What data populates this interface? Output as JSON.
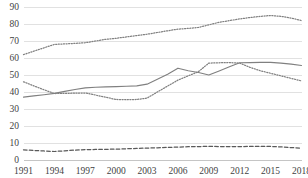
{
  "chart_data": {
    "type": "line",
    "title": "",
    "subtitle": "",
    "xlabel": "",
    "ylabel": "",
    "grid": true,
    "legend": "none",
    "xlim": [
      1991,
      2018
    ],
    "ylim": [
      0,
      90
    ],
    "yticks": [
      0,
      10,
      20,
      30,
      40,
      50,
      60,
      70,
      80,
      90
    ],
    "ytick_labels": [
      "0",
      "10",
      "20",
      "30",
      "40",
      "50",
      "60",
      "70",
      "80",
      "90"
    ],
    "xticks": [
      1991,
      1994,
      1997,
      2000,
      2003,
      2006,
      2009,
      2012,
      2015,
      2018
    ],
    "xtick_labels": [
      "1991",
      "1994",
      "1997",
      "2000",
      "2003",
      "2006",
      "2009",
      "2012",
      "2015",
      "2018"
    ],
    "x": [
      1991,
      1992,
      1993,
      1994,
      1995,
      1996,
      1997,
      1998,
      1999,
      2000,
      2001,
      2002,
      2003,
      2004,
      2005,
      2006,
      2007,
      2008,
      2009,
      2010,
      2011,
      2012,
      2013,
      2014,
      2015,
      2016,
      2017,
      2018
    ],
    "series": [
      {
        "name": "series-top-dotted",
        "style": "dotted",
        "color": "#808080",
        "values": [
          62.0,
          64.0,
          66.0,
          68.0,
          68.3,
          68.6,
          69.0,
          70.0,
          71.0,
          71.6,
          72.4,
          73.2,
          74.0,
          75.0,
          76.0,
          77.0,
          77.4,
          78.0,
          79.5,
          81.0,
          82.0,
          83.0,
          83.8,
          84.5,
          85.0,
          84.5,
          83.5,
          82.0
        ]
      },
      {
        "name": "series-solid",
        "style": "solid",
        "color": "#808080",
        "values": [
          37.0,
          37.7,
          38.4,
          39.2,
          40.4,
          41.5,
          42.4,
          42.8,
          43.0,
          43.2,
          43.4,
          43.6,
          44.6,
          47.5,
          50.5,
          54.0,
          52.5,
          51.5,
          50.0,
          52.4,
          54.8,
          57.2,
          57.3,
          57.4,
          57.4,
          57.0,
          56.4,
          55.6
        ]
      },
      {
        "name": "series-middle-dotted",
        "style": "dotted",
        "color": "#808080",
        "values": [
          46.0,
          43.6,
          41.3,
          39.1,
          39.2,
          39.3,
          39.4,
          38.2,
          36.9,
          35.6,
          35.5,
          35.6,
          36.4,
          40.0,
          43.5,
          47.0,
          49.5,
          52.0,
          57.0,
          57.2,
          57.3,
          57.0,
          54.5,
          52.5,
          51.0,
          49.5,
          48.0,
          46.5
        ]
      },
      {
        "name": "series-bottom-dashed",
        "style": "dashed",
        "color": "#595959",
        "values": [
          6.0,
          5.6,
          5.3,
          5.0,
          5.4,
          5.8,
          6.1,
          6.2,
          6.3,
          6.4,
          6.6,
          6.8,
          7.0,
          7.2,
          7.4,
          7.6,
          7.8,
          7.9,
          8.0,
          7.9,
          7.9,
          7.9,
          8.0,
          8.0,
          8.0,
          7.7,
          7.3,
          7.0
        ]
      }
    ]
  }
}
